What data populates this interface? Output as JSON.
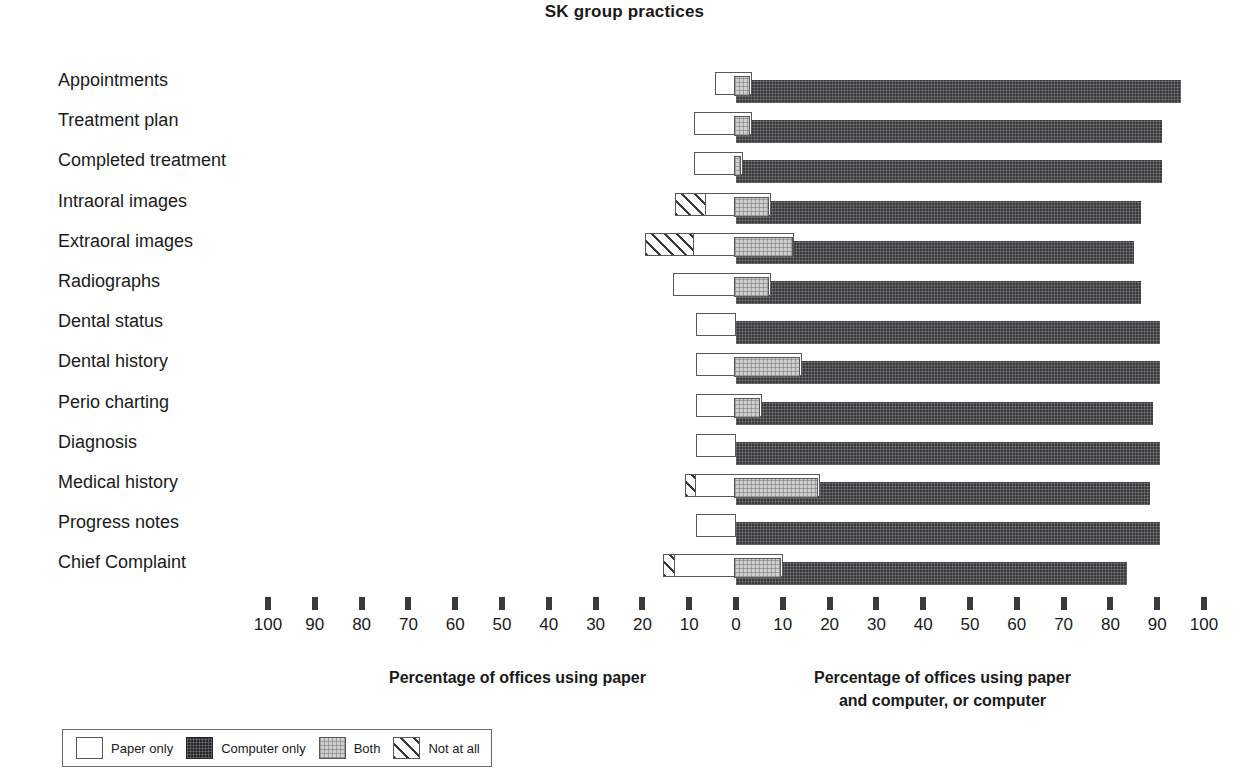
{
  "chart_data": {
    "type": "bar",
    "title": "SK group practices",
    "orientation": "horizontal-diverging",
    "categories": [
      "Appointments",
      "Treatment plan",
      "Completed treatment",
      "Intraoral images",
      "Extraoral images",
      "Radiographs",
      "Dental status",
      "Dental history",
      "Perio charting",
      "Diagnosis",
      "Medical history",
      "Progress notes",
      "Chief Complaint"
    ],
    "series": [
      {
        "name": "Paper only",
        "side": "left",
        "values": [
          4.5,
          9,
          9,
          6.5,
          9,
          13.5,
          8.5,
          8.5,
          8.5,
          8.5,
          8.5,
          8.5,
          13
        ]
      },
      {
        "name": "Not at all",
        "side": "left",
        "values": [
          0,
          0,
          0,
          6.5,
          10.5,
          0,
          0,
          0,
          0,
          0,
          2.5,
          0,
          2.5
        ]
      },
      {
        "name": "Both",
        "side": "right",
        "values": [
          3.5,
          3.5,
          1.5,
          7.5,
          12.5,
          7.5,
          0,
          14,
          5.5,
          0,
          18,
          0,
          10
        ]
      },
      {
        "name": "Computer only",
        "side": "right",
        "values": [
          95,
          91,
          91,
          86.5,
          85,
          86.5,
          90.5,
          90.5,
          89,
          90.5,
          88.5,
          90.5,
          83.5
        ]
      }
    ],
    "xlabel_left": "Percentage of offices using paper",
    "xlabel_right": "Percentage of offices using paper\nand computer, or computer",
    "ylabel": "",
    "xlim_left": [
      0,
      100
    ],
    "xlim_right": [
      0,
      100
    ],
    "grid": false,
    "tick_labels": [
      "100",
      "90",
      "80",
      "70",
      "60",
      "50",
      "40",
      "30",
      "20",
      "10",
      "0",
      "10",
      "20",
      "30",
      "40",
      "50",
      "60",
      "70",
      "80",
      "90",
      "100"
    ],
    "legend_position": "bottom-left"
  },
  "axis": {
    "left_caption": "Percentage of offices using paper",
    "right_caption_line1": "Percentage of offices using paper",
    "right_caption_line2": "and computer, or computer"
  },
  "legend": {
    "items": [
      {
        "label": "Paper only",
        "swatch": "paper-only-swatch"
      },
      {
        "label": "Computer only",
        "swatch": "computer-only-swatch"
      },
      {
        "label": "Both",
        "swatch": "both-swatch"
      },
      {
        "label": "Not at all",
        "swatch": "not-at-all-swatch"
      }
    ]
  },
  "colors": {
    "paper_only": "#ffffff",
    "computer_only": "#3a3a3c",
    "both": "#cfcfcf",
    "not_at_all": "#3a3a3c",
    "text": "#1a1a1a",
    "outline": "#58585a"
  }
}
